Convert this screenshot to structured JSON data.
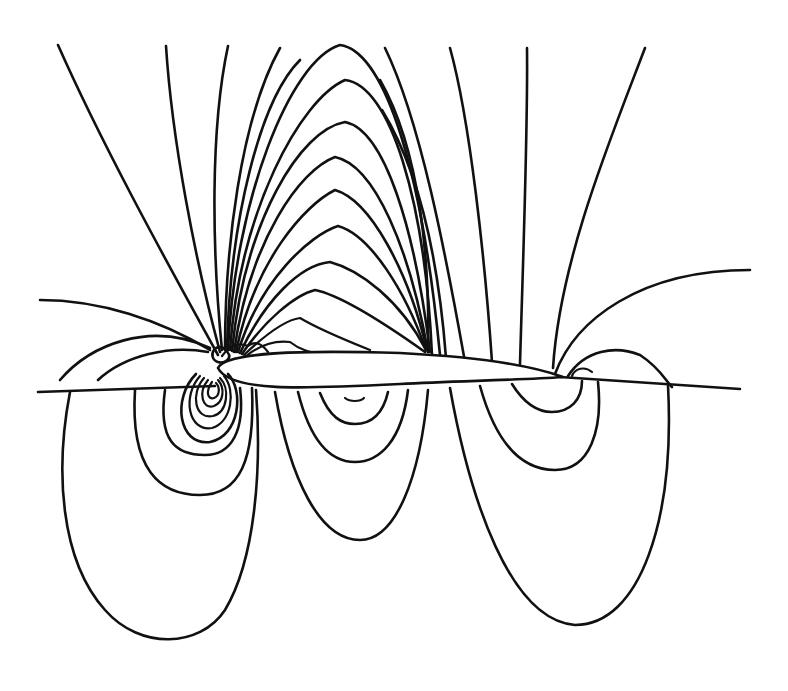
{
  "figure": {
    "type": "contour-plot",
    "background_color": "#ffffff",
    "line_color": "#111111",
    "labels": []
  },
  "regions": {
    "upper_fan": "dense contour fan emanating from the leading edge over the upper surface",
    "lower_loops": "three families of closed loops below the chord line",
    "trailing_edge": "small loops near the trailing edge"
  }
}
